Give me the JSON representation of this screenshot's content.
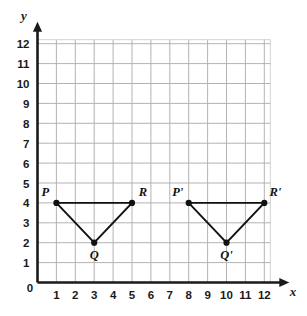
{
  "figure": {
    "background_color": "#ffffff",
    "grid_color": "#b3b3b3",
    "axis_color": "#1a1a1a",
    "shape_color": "#111111"
  },
  "axes": {
    "x": {
      "label": "x",
      "min": 0,
      "max": 12,
      "ticks": [
        "1",
        "2",
        "3",
        "4",
        "5",
        "6",
        "7",
        "8",
        "9",
        "10",
        "11",
        "12"
      ],
      "arrow": true
    },
    "y": {
      "label": "y",
      "min": 0,
      "max": 12,
      "ticks": [
        "1",
        "2",
        "3",
        "4",
        "5",
        "6",
        "7",
        "8",
        "9",
        "10",
        "11",
        "12"
      ],
      "arrow": true
    },
    "origin_label": "0"
  },
  "chart_data": {
    "type": "scatter",
    "title": "",
    "xlabel": "x",
    "ylabel": "y",
    "xlim": [
      0,
      12
    ],
    "ylim": [
      0,
      12
    ],
    "grid": true,
    "legend": "none",
    "shapes": [
      {
        "name": "triangle-pqr",
        "vertices": [
          {
            "label": "P",
            "x": 1,
            "y": 4,
            "label_pos": "above-left"
          },
          {
            "label": "Q",
            "x": 3,
            "y": 2,
            "label_pos": "below"
          },
          {
            "label": "R",
            "x": 5,
            "y": 4,
            "label_pos": "above-right"
          }
        ]
      },
      {
        "name": "triangle-pqr-prime",
        "vertices": [
          {
            "label": "P'",
            "x": 8,
            "y": 4,
            "label_pos": "above-left"
          },
          {
            "label": "Q'",
            "x": 10,
            "y": 2,
            "label_pos": "below"
          },
          {
            "label": "R'",
            "x": 12,
            "y": 4,
            "label_pos": "above-right"
          }
        ]
      }
    ]
  }
}
